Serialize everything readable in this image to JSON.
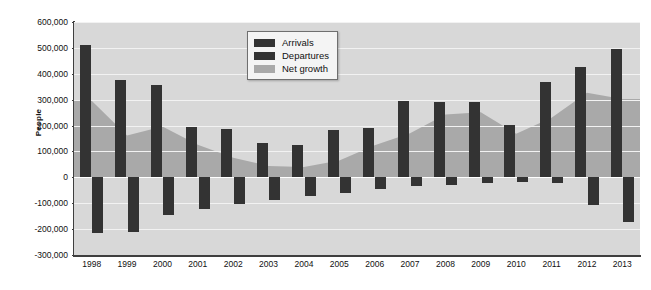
{
  "chart_data": {
    "type": "bar",
    "title": "",
    "xlabel": "",
    "ylabel": "People",
    "ylim": [
      -300000,
      600000
    ],
    "ytick_step": 100000,
    "ytick_labels": [
      "600,000",
      "500,000",
      "400,000",
      "300,000",
      "200,000",
      "100,000",
      "0",
      "-100,000",
      "-200,000",
      "-300,000"
    ],
    "ytick_values": [
      600000,
      500000,
      400000,
      300000,
      200000,
      100000,
      0,
      -100000,
      -200000,
      -300000
    ],
    "grid": true,
    "legend_position": "top-center",
    "categories": [
      "1998",
      "1999",
      "2000",
      "2001",
      "2002",
      "2003",
      "2004",
      "2005",
      "2006",
      "2007",
      "2008",
      "2009",
      "2010",
      "2011",
      "2012",
      "2013"
    ],
    "series": [
      {
        "name": "Arrivals",
        "color": "#333333",
        "kind": "bar",
        "values": [
          510000,
          375000,
          358000,
          194000,
          187000,
          132000,
          123000,
          182000,
          192000,
          295000,
          291000,
          290000,
          201000,
          368000,
          428000,
          494000
        ]
      },
      {
        "name": "Departures",
        "color": "#333333",
        "kind": "bar",
        "values": [
          -214000,
          -213000,
          -144000,
          -121000,
          -103000,
          -86000,
          -74000,
          -62000,
          -45000,
          -33000,
          -28000,
          -20000,
          -19000,
          -21000,
          -107000,
          -173000
        ]
      },
      {
        "name": "Net growth",
        "color": "#a9a9a9",
        "kind": "area",
        "values": [
          296000,
          162000,
          196000,
          126000,
          76000,
          44000,
          40000,
          65000,
          124000,
          170000,
          243000,
          251000,
          168000,
          230000,
          327000,
          303000
        ]
      }
    ]
  },
  "legend": {
    "items": [
      {
        "label": "Arrivals",
        "color": "#333333"
      },
      {
        "label": "Departures",
        "color": "#333333"
      },
      {
        "label": "Net growth",
        "color": "#a9a9a9"
      }
    ]
  }
}
